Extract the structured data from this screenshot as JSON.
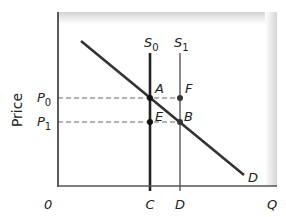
{
  "diagram": {
    "type": "supply-demand",
    "y_axis_label": "Price",
    "x_axis_label": "Q",
    "origin_label": "0",
    "price_levels": [
      {
        "label": "P",
        "sub": "0",
        "name": "P0"
      },
      {
        "label": "P",
        "sub": "1",
        "name": "P1"
      }
    ],
    "quantity_levels": [
      {
        "label": "C",
        "name": "C"
      },
      {
        "label": "D",
        "name": "D"
      }
    ],
    "curves": {
      "supply_0": {
        "label": "S",
        "sub": "0",
        "color": "#222222"
      },
      "supply_1": {
        "label": "S",
        "sub": "1",
        "color": "#8a8a8a"
      },
      "demand": {
        "label": "D",
        "color": "#333333"
      }
    },
    "points": {
      "A": "A",
      "B": "B",
      "E": "E",
      "F": "F"
    },
    "colors": {
      "axis": "#333333",
      "dashed": "#9a9a9a",
      "shade": "#d9d9d9"
    }
  }
}
